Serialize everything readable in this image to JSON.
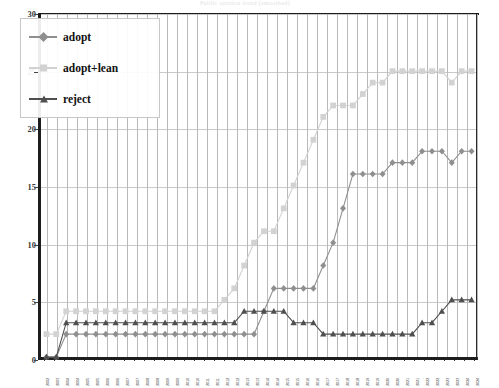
{
  "title": "Public opinion trend (smoothed)",
  "legend": {
    "position": "top-left",
    "items": [
      {
        "label": "adopt",
        "color": "#8f8f8f",
        "marker": "diamond"
      },
      {
        "label": "adopt+lean",
        "color": "#d2d2d2",
        "marker": "square"
      },
      {
        "label": "reject",
        "color": "#4f4f4f",
        "marker": "triangle"
      }
    ]
  },
  "chart_data": {
    "type": "line",
    "title": "Public opinion trend (smoothed)",
    "xlabel": "",
    "ylabel": "",
    "ylim": [
      0,
      30
    ],
    "yticks": [
      0,
      5,
      10,
      15,
      20,
      25,
      30
    ],
    "grid": true,
    "legend_position": "top-left",
    "categories": [
      "2002",
      "2003",
      "2004",
      "2004",
      "2005",
      "2005",
      "2006",
      "2006",
      "2007",
      "2007",
      "2008",
      "2008",
      "2009",
      "2009",
      "2010",
      "2010",
      "2011",
      "2011",
      "2012",
      "2012",
      "2013",
      "2013",
      "2014",
      "2014",
      "2015",
      "2015",
      "2016",
      "2016",
      "2017",
      "2017",
      "2018",
      "2018",
      "2019",
      "2019",
      "2020",
      "2020",
      "2021",
      "2021",
      "2022",
      "2022",
      "2023",
      "2023",
      "2024",
      "2024"
    ],
    "series": [
      {
        "name": "adopt",
        "color": "#8f8f8f",
        "marker": "diamond",
        "values": [
          0,
          0,
          2,
          2,
          2,
          2,
          2,
          2,
          2,
          2,
          2,
          2,
          2,
          2,
          2,
          2,
          2,
          2,
          2,
          2,
          2,
          2,
          4,
          6,
          6,
          6,
          6,
          6,
          8,
          10,
          13,
          16,
          16,
          16,
          16,
          17,
          17,
          17,
          18,
          18,
          18,
          17,
          18,
          18
        ]
      },
      {
        "name": "adopt+lean",
        "color": "#d2d2d2",
        "marker": "square",
        "values": [
          2,
          2,
          4,
          4,
          4,
          4,
          4,
          4,
          4,
          4,
          4,
          4,
          4,
          4,
          4,
          4,
          4,
          4,
          5,
          6,
          8,
          10,
          11,
          11,
          13,
          15,
          17,
          19,
          21,
          22,
          22,
          22,
          23,
          24,
          24,
          25,
          25,
          25,
          25,
          25,
          25,
          24,
          25,
          25
        ]
      },
      {
        "name": "reject",
        "color": "#4f4f4f",
        "marker": "triangle",
        "values": [
          0,
          0,
          3,
          3,
          3,
          3,
          3,
          3,
          3,
          3,
          3,
          3,
          3,
          3,
          3,
          3,
          3,
          3,
          3,
          3,
          4,
          4,
          4,
          4,
          4,
          3,
          3,
          3,
          2,
          2,
          2,
          2,
          2,
          2,
          2,
          2,
          2,
          2,
          3,
          3,
          4,
          5,
          5,
          5
        ]
      }
    ]
  }
}
